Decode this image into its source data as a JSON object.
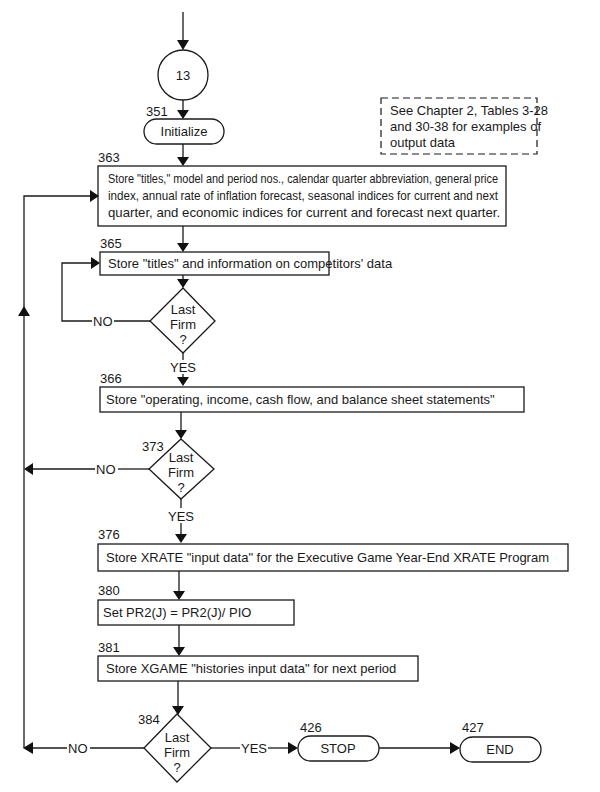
{
  "connector": {
    "label": "13"
  },
  "note": {
    "lines": [
      "See Chapter 2, Tables 3-28",
      "and 30-38 for examples of",
      "output data"
    ]
  },
  "steps": {
    "s351": {
      "number": "351",
      "label": "Initialize"
    },
    "s363": {
      "number": "363",
      "lines": [
        "Store \"titles,\" model and period nos., calendar quarter abbreviation, general price",
        "index, annual rate of inflation forecast, seasonal indices for current and next",
        "quarter, and economic indices for current and forecast next quarter."
      ]
    },
    "s365": {
      "number": "365",
      "label": "Store \"titles\" and information on competitors' data"
    },
    "d1": {
      "lines": [
        "Last",
        "Firm",
        "?"
      ],
      "no": "NO",
      "yes": "YES"
    },
    "s366": {
      "number": "366",
      "label": "Store \"operating, income, cash flow, and balance sheet statements\""
    },
    "s373": {
      "number": "373",
      "lines": [
        "Last",
        "Firm",
        "?"
      ],
      "no": "NO",
      "yes": "YES"
    },
    "s376": {
      "number": "376",
      "label": "Store XRATE \"input data\" for the Executive Game Year-End XRATE Program"
    },
    "s380": {
      "number": "380",
      "label": "Set PR2(J) = PR2(J)/ PIO"
    },
    "s381": {
      "number": "381",
      "label": "Store XGAME \"histories input data\" for next period"
    },
    "s384": {
      "number": "384",
      "lines": [
        "Last",
        "Firm",
        "?"
      ],
      "no": "NO",
      "yes": "YES"
    },
    "s426": {
      "number": "426",
      "label": "STOP"
    },
    "s427": {
      "number": "427",
      "label": "END"
    }
  }
}
